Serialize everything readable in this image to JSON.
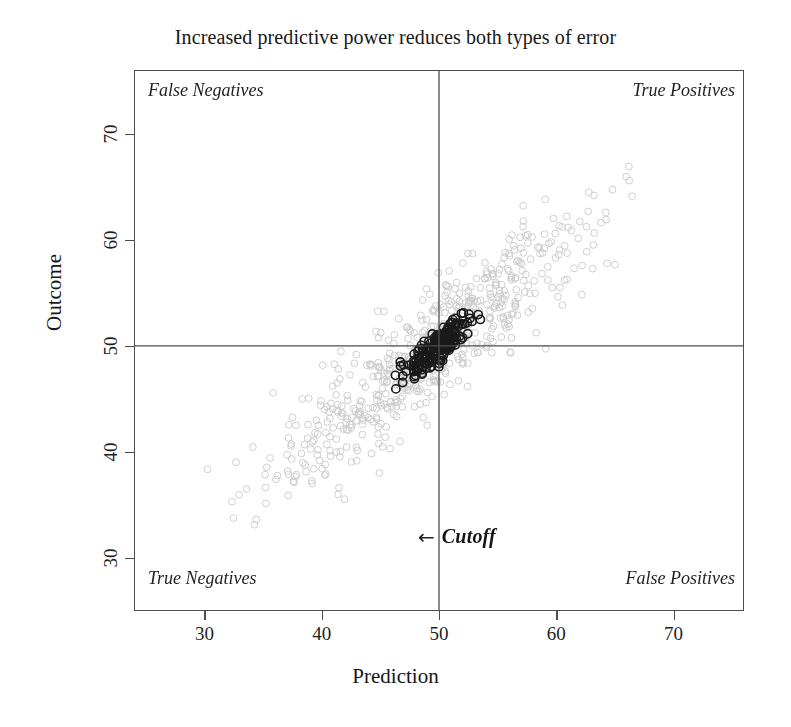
{
  "chart_data": {
    "type": "scatter",
    "title": "Increased predictive power reduces both types of error",
    "xlabel": "Prediction",
    "ylabel": "Outcome",
    "xlim": [
      24,
      76
    ],
    "ylim": [
      25,
      76
    ],
    "xticks": [
      30,
      40,
      50,
      60,
      70
    ],
    "yticks": [
      30,
      40,
      50,
      60,
      70
    ],
    "grid": false,
    "legend": "none",
    "cutoff_x": 50,
    "cutoff_y": 50,
    "cutoff_label": "Cutoff",
    "cutoff_arrow": "←",
    "quadrants": {
      "top_left": "False Negatives",
      "top_right": "True Positives",
      "bottom_left": "True Negatives",
      "bottom_right": "False Positives"
    },
    "colors": {
      "weak_series": "#c9c9c9",
      "strong_series": "#1a1a1a",
      "axis": "#4d4d4d",
      "text": "#1a1a1a",
      "background": "#ffffff"
    },
    "series": [
      {
        "name": "Low predictive power",
        "marker": "open-circle",
        "color": "#c9c9c9",
        "radius": 3.4,
        "n": 620,
        "distribution": {
          "mean_x": 49.5,
          "mean_y": 49.6,
          "sd_x": 6.6,
          "sd_y": 6.4,
          "correlation": 0.9
        },
        "extent_x": [
          29.5,
          66.5
        ],
        "extent_y": [
          32.0,
          67.5
        ]
      },
      {
        "name": "High predictive power",
        "marker": "open-circle",
        "color": "#1a1a1a",
        "radius": 4.1,
        "n": 185,
        "distribution": {
          "mean_x": 50.0,
          "mean_y": 49.9,
          "sd_x": 1.45,
          "sd_y": 1.5,
          "correlation": 0.86
        },
        "extent_x": [
          44.6,
          56.2
        ],
        "extent_y": [
          45.3,
          53.5
        ]
      }
    ]
  },
  "figure": {
    "title": "Increased predictive power reduces both types of error",
    "xaxis_title": "Prediction",
    "yaxis_title": "Outcome",
    "xtick_labels": [
      "30",
      "40",
      "50",
      "60",
      "70"
    ],
    "ytick_labels": [
      "30",
      "40",
      "50",
      "60",
      "70"
    ],
    "quadrant_top_left": "False Negatives",
    "quadrant_top_right": "True Positives",
    "quadrant_bottom_left": "True Negatives",
    "quadrant_bottom_right": "False Positives",
    "cutoff_arrow": "←",
    "cutoff_label": "Cutoff"
  }
}
